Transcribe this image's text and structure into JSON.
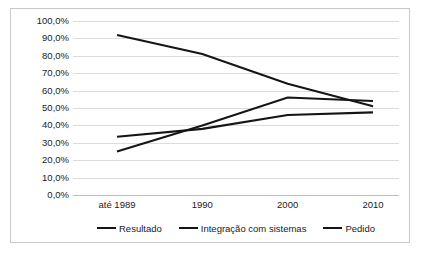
{
  "chart_data": {
    "type": "line",
    "title": "",
    "subtitle": "",
    "xlabel": "",
    "ylabel": "",
    "categories": [
      "até 1989",
      "1990",
      "2000",
      "2010"
    ],
    "ylim": [
      0,
      100
    ],
    "ytick_labels": [
      "0,0%",
      "10,0%",
      "20,0%",
      "30,0%",
      "40,0%",
      "50,0%",
      "60,0%",
      "70,0%",
      "80,0%",
      "90,0%",
      "100,0%"
    ],
    "ytick_values": [
      0,
      10,
      20,
      30,
      40,
      50,
      60,
      70,
      80,
      90,
      100
    ],
    "grid": true,
    "grid_axis": "y",
    "legend_position": "bottom",
    "series": [
      {
        "name": "Resultado",
        "color": "#151515",
        "values": [
          92.0,
          81.0,
          64.0,
          51.0
        ]
      },
      {
        "name": "Integração com sistemas",
        "color": "#151515",
        "values": [
          33.5,
          38.0,
          46.0,
          47.5
        ]
      },
      {
        "name": "Pedido",
        "color": "#151515",
        "values": [
          25.0,
          40.0,
          56.0,
          54.0
        ]
      }
    ]
  },
  "legend": {
    "items": [
      {
        "label": "Resultado"
      },
      {
        "label": "Integração com sistemas"
      },
      {
        "label": "Pedido"
      }
    ]
  },
  "colors": {
    "series_line": "#151515",
    "gridline": "#dcdcdc",
    "frame_border": "#c9c9c9",
    "background": "#ffffff",
    "text": "#1a1a1a"
  }
}
